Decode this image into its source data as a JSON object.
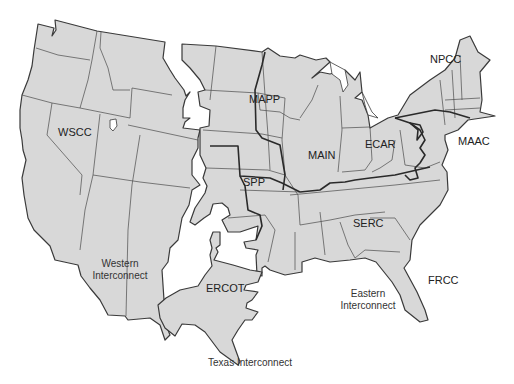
{
  "map": {
    "title": "North American Electric Reliability Council regions and interconnections (contiguous U.S.)",
    "colors": {
      "land_fill": "#d8d8d8",
      "state_stroke": "#4a4a4a",
      "region_stroke": "#2a2a2a",
      "background": "#ffffff"
    },
    "regions": [
      {
        "id": "WSCC",
        "label": "WSCC",
        "interconnect": "Western"
      },
      {
        "id": "MAPP",
        "label": "MAPP",
        "interconnect": "Eastern"
      },
      {
        "id": "NPCC",
        "label": "NPCC",
        "interconnect": "Eastern"
      },
      {
        "id": "MAIN",
        "label": "MAIN",
        "interconnect": "Eastern"
      },
      {
        "id": "ECAR",
        "label": "ECAR",
        "interconnect": "Eastern"
      },
      {
        "id": "MAAC",
        "label": "MAAC",
        "interconnect": "Eastern"
      },
      {
        "id": "SPP",
        "label": "SPP",
        "interconnect": "Eastern"
      },
      {
        "id": "SERC",
        "label": "SERC",
        "interconnect": "Eastern"
      },
      {
        "id": "FRCC",
        "label": "FRCC",
        "interconnect": "Eastern"
      },
      {
        "id": "ERCOT",
        "label": "ERCOT",
        "interconnect": "Texas"
      }
    ],
    "interconnects": {
      "western": {
        "line1": "Western",
        "line2": "Interconnect"
      },
      "eastern": {
        "line1": "Eastern",
        "line2": "Interconnect"
      },
      "texas": {
        "label": "Texas Interconnect"
      }
    }
  }
}
